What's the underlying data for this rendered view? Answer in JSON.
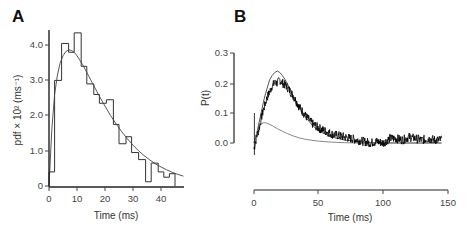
{
  "chart_data": [
    {
      "panel": "A",
      "type": "bar",
      "subtype": "histogram_with_fit",
      "title": "",
      "xlabel": "Time (ms)",
      "ylabel": "pdf × 10² (ms⁻¹)",
      "xlim": [
        0,
        48
      ],
      "ylim": [
        0,
        4.4
      ],
      "xticks": [
        "0",
        "10",
        "20",
        "30",
        "40"
      ],
      "yticks": [
        "0",
        "1.0",
        "2.0",
        "3.0",
        "4.0"
      ],
      "grid": false,
      "bins": [
        {
          "x0": 0,
          "x1": 2,
          "value": 0.4
        },
        {
          "x0": 2,
          "x1": 4.5,
          "value": 3.0
        },
        {
          "x0": 4.5,
          "x1": 7,
          "value": 4.05
        },
        {
          "x0": 7,
          "x1": 9,
          "value": 3.8
        },
        {
          "x0": 9,
          "x1": 11.5,
          "value": 4.35
        },
        {
          "x0": 11.5,
          "x1": 13.5,
          "value": 3.4
        },
        {
          "x0": 13.5,
          "x1": 16,
          "value": 2.9
        },
        {
          "x0": 16,
          "x1": 18,
          "value": 2.6
        },
        {
          "x0": 18,
          "x1": 20.5,
          "value": 2.35
        },
        {
          "x0": 20.5,
          "x1": 23,
          "value": 2.45
        },
        {
          "x0": 23,
          "x1": 25,
          "value": 1.75
        },
        {
          "x0": 25,
          "x1": 27.5,
          "value": 1.2
        },
        {
          "x0": 27.5,
          "x1": 29.5,
          "value": 1.4
        },
        {
          "x0": 29.5,
          "x1": 32,
          "value": 0.95
        },
        {
          "x0": 32,
          "x1": 34.5,
          "value": 0.75
        },
        {
          "x0": 34.5,
          "x1": 36.5,
          "value": 0.12
        },
        {
          "x0": 36.5,
          "x1": 39,
          "value": 0.65
        },
        {
          "x0": 39,
          "x1": 41,
          "value": 0.4
        },
        {
          "x0": 41,
          "x1": 43,
          "value": 0.25
        },
        {
          "x0": 43,
          "x1": 45,
          "value": 0.35
        }
      ],
      "fit_curve": {
        "name": "fit",
        "x": [
          0,
          1,
          2,
          3,
          4,
          5,
          6,
          7,
          8,
          9,
          10,
          12,
          14,
          16,
          18,
          20,
          22,
          24,
          26,
          28,
          30,
          32,
          34,
          36,
          38,
          40,
          42,
          44,
          46,
          48
        ],
        "y": [
          0,
          1.6,
          2.6,
          3.15,
          3.5,
          3.7,
          3.82,
          3.87,
          3.85,
          3.8,
          3.7,
          3.45,
          3.15,
          2.85,
          2.55,
          2.27,
          2.0,
          1.76,
          1.54,
          1.34,
          1.16,
          1.0,
          0.86,
          0.74,
          0.63,
          0.54,
          0.46,
          0.39,
          0.33,
          0.28
        ]
      }
    },
    {
      "panel": "B",
      "type": "line",
      "title": "",
      "xlabel": "Time (ms)",
      "ylabel": "P(t)",
      "xlim": [
        0,
        150
      ],
      "ylim": [
        -0.05,
        0.3
      ],
      "xticks": [
        "0",
        "50",
        "100",
        "150"
      ],
      "yticks": [
        "0.0",
        "0.1",
        "0.2",
        "0.3"
      ],
      "grid": false,
      "series": [
        {
          "name": "noisy data",
          "color": "#000000",
          "x": [
            0,
            2,
            4,
            6,
            8,
            10,
            12,
            14,
            16,
            18,
            20,
            22,
            25,
            30,
            35,
            40,
            45,
            50,
            55,
            60,
            65,
            70,
            75,
            80,
            85,
            90,
            95,
            100,
            105,
            110,
            115,
            120,
            125,
            130,
            135,
            140,
            145
          ],
          "y": [
            -0.02,
            0.02,
            0.05,
            0.09,
            0.12,
            0.15,
            0.17,
            0.19,
            0.2,
            0.2,
            0.21,
            0.2,
            0.19,
            0.16,
            0.12,
            0.09,
            0.065,
            0.05,
            0.04,
            0.03,
            0.025,
            0.02,
            0.015,
            0.01,
            0.005,
            0.0,
            0.005,
            0.0,
            0.015,
            0.015,
            0.01,
            0.02,
            0.015,
            0.01,
            0.015,
            0.01,
            0.01
          ]
        },
        {
          "name": "model peak",
          "color": "#555555",
          "x": [
            0,
            2,
            4,
            6,
            8,
            10,
            12,
            14,
            16,
            18,
            20,
            22,
            25,
            30,
            35,
            40,
            45,
            50,
            60,
            70,
            80,
            90,
            100,
            120,
            145
          ],
          "y": [
            0,
            0.03,
            0.07,
            0.11,
            0.15,
            0.18,
            0.21,
            0.225,
            0.235,
            0.24,
            0.235,
            0.225,
            0.205,
            0.16,
            0.12,
            0.085,
            0.06,
            0.04,
            0.02,
            0.01,
            0.005,
            0.002,
            0.0,
            0.0,
            0.0
          ]
        },
        {
          "name": "model small",
          "color": "#888888",
          "x": [
            0,
            2,
            4,
            6,
            8,
            10,
            14,
            18,
            22,
            26,
            30,
            35,
            40,
            50,
            60,
            70,
            80,
            100,
            145
          ],
          "y": [
            0,
            0.03,
            0.055,
            0.065,
            0.068,
            0.066,
            0.058,
            0.048,
            0.039,
            0.031,
            0.024,
            0.017,
            0.012,
            0.006,
            0.003,
            0.001,
            0.0,
            0.0,
            0.0
          ]
        }
      ]
    }
  ],
  "panels": {
    "a": {
      "label": "A",
      "xlabel": "Time (ms)",
      "ylabel": "pdf × 10² (ms⁻¹)",
      "xticks": [
        "0",
        "10",
        "20",
        "30",
        "40"
      ],
      "yticks": [
        "0",
        "1.0",
        "2.0",
        "3.0",
        "4.0"
      ]
    },
    "b": {
      "label": "B",
      "xlabel": "Time (ms)",
      "ylabel": "P(t)",
      "xticks": [
        "0",
        "50",
        "100",
        "150"
      ],
      "yticks": [
        "0.0",
        "0.1",
        "0.2",
        "0.3"
      ]
    }
  }
}
